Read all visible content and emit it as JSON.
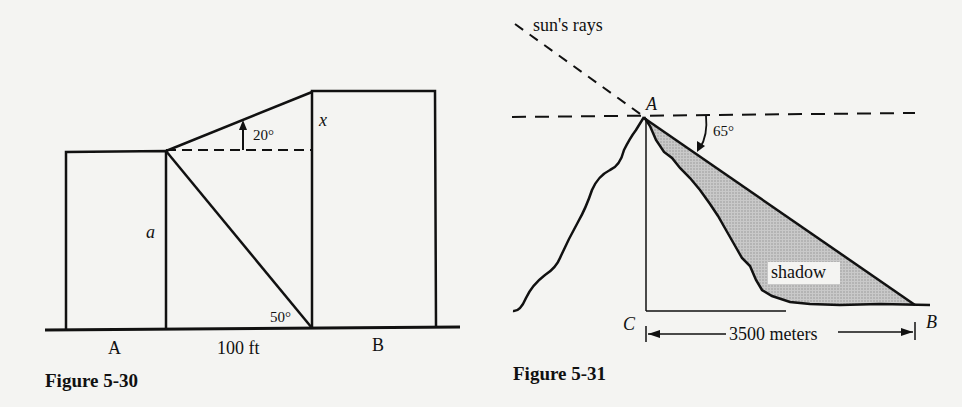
{
  "figures": [
    {
      "id": "figure-5-30",
      "caption": "Figure 5-30",
      "labels": {
        "building_a": "A",
        "building_b": "B",
        "distance": "100 ft",
        "height_a": "a",
        "height_x": "x",
        "angle_elevation": "20°",
        "angle_depression": "50°"
      },
      "elements": {
        "ground_line": "ground",
        "building_a": "rectangle",
        "building_b": "rectangle (taller)",
        "dashed_horizontal": "from top of A to B",
        "line_of_sight_up": "to top of B",
        "line_of_sight_down": "to base of B"
      }
    },
    {
      "id": "figure-5-31",
      "caption": "Figure 5-31",
      "labels": {
        "rays": "sun's rays",
        "peak": "A",
        "foot": "C",
        "shadow_end": "B",
        "shadow": "shadow",
        "angle": "65°",
        "distance": "3500 meters"
      },
      "colors": {
        "shadow_fill": "#b9b9b9"
      }
    }
  ]
}
